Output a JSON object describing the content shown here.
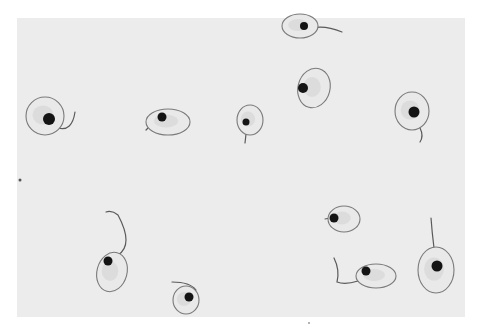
{
  "image": {
    "description": "Grayscale light micrograph of stained flagellated protozoan cells (promastigote-like) scattered on a pale field",
    "frame": {
      "x": 17,
      "y": 18,
      "width": 448,
      "height": 299
    },
    "colors": {
      "margin": "#ffffff",
      "field": "#ececec",
      "cell_outline": "#7a7a7a",
      "nucleus": "#141414",
      "flagellum": "#5a5a5a"
    }
  },
  "cells": [
    {
      "id": "cell-1",
      "cx": 45,
      "cy": 116,
      "rx": 19,
      "ry": 19,
      "rot": 0,
      "nx": 49,
      "ny": 119,
      "nr": 6,
      "flag": "M58,128 Q72,132 75,112"
    },
    {
      "id": "cell-2",
      "cx": 168,
      "cy": 122,
      "rx": 22,
      "ry": 13,
      "rot": 0,
      "nx": 162,
      "ny": 117,
      "nr": 4.5,
      "flag": "M156,120 Q150,126 146,130"
    },
    {
      "id": "cell-3",
      "cx": 250,
      "cy": 120,
      "rx": 13,
      "ry": 15,
      "rot": 0,
      "nx": 246,
      "ny": 122,
      "nr": 3.5,
      "flag": "M246,134 L245,143"
    },
    {
      "id": "cell-4",
      "cx": 314,
      "cy": 88,
      "rx": 16,
      "ry": 20,
      "rot": 15,
      "nx": 303,
      "ny": 88,
      "nr": 5,
      "flag": ""
    },
    {
      "id": "cell-5",
      "cx": 300,
      "cy": 26,
      "rx": 18,
      "ry": 12,
      "rot": 0,
      "nx": 304,
      "ny": 26,
      "nr": 4,
      "flag": "M312,28 Q325,25 342,32"
    },
    {
      "id": "cell-6",
      "cx": 412,
      "cy": 111,
      "rx": 17,
      "ry": 19,
      "rot": 0,
      "nx": 414,
      "ny": 112,
      "nr": 5.5,
      "flag": "M420,128 Q424,136 420,142"
    },
    {
      "id": "cell-7",
      "cx": 112,
      "cy": 272,
      "rx": 15,
      "ry": 20,
      "rot": 15,
      "nx": 108,
      "ny": 261,
      "nr": 4.5,
      "flag": "M118,255 Q134,245 118,215 Q112,210 106,212"
    },
    {
      "id": "cell-8",
      "cx": 186,
      "cy": 300,
      "rx": 13,
      "ry": 14,
      "rot": 0,
      "nx": 189,
      "ny": 297,
      "nr": 4.5,
      "flag": "M196,290 Q190,282 172,282"
    },
    {
      "id": "cell-9",
      "cx": 344,
      "cy": 219,
      "rx": 16,
      "ry": 13,
      "rot": 0,
      "nx": 334,
      "ny": 218,
      "nr": 4.5,
      "flag": "M330,218 L325,219"
    },
    {
      "id": "cell-10",
      "cx": 376,
      "cy": 276,
      "rx": 20,
      "ry": 12,
      "rot": 0,
      "nx": 366,
      "ny": 271,
      "nr": 4.5,
      "flag": "M358,281 Q345,285 337,282 Q340,270 334,258"
    },
    {
      "id": "cell-11",
      "cx": 436,
      "cy": 270,
      "rx": 18,
      "ry": 23,
      "rot": 0,
      "nx": 437,
      "ny": 266,
      "nr": 5.5,
      "flag": "M434,248 Q432,232 431,218"
    }
  ],
  "specks": [
    {
      "x": 20,
      "y": 180,
      "r": 1.5
    },
    {
      "x": 309,
      "y": 323,
      "r": 0.8
    }
  ]
}
